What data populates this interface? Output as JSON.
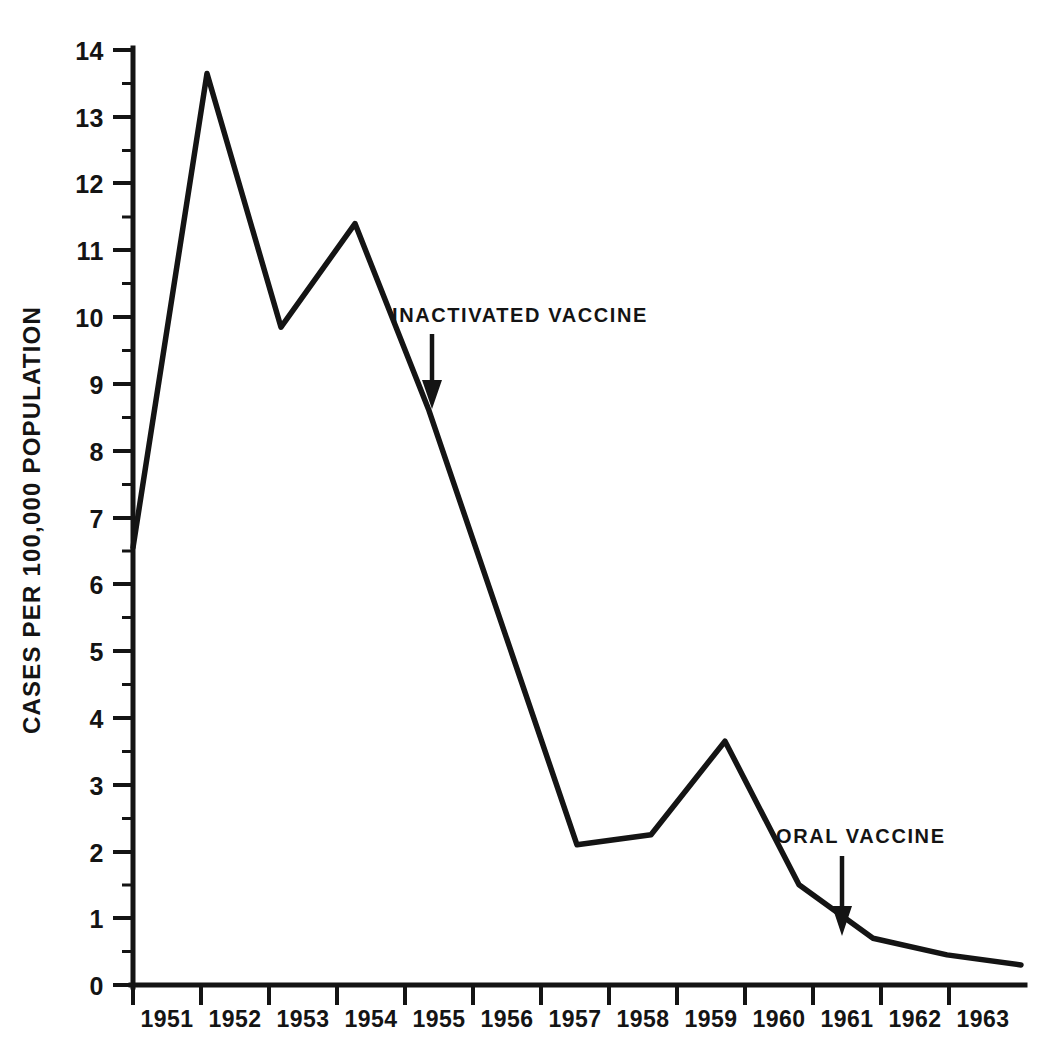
{
  "chart_data": {
    "type": "line",
    "title": "",
    "subtitle": "",
    "xlabel": "",
    "ylabel": "CASES PER 100,000 POPULATION",
    "x": [
      1951,
      1952,
      1953,
      1954,
      1955,
      1956,
      1957,
      1958,
      1959,
      1960,
      1961,
      1962,
      1963
    ],
    "categories": [
      "1951",
      "1952",
      "1953",
      "1954",
      "1955",
      "1956",
      "1957",
      "1958",
      "1959",
      "1960",
      "1961",
      "1962",
      "1963"
    ],
    "values": [
      6.55,
      13.65,
      9.85,
      11.4,
      8.6,
      5.35,
      2.1,
      2.25,
      3.65,
      1.5,
      0.7,
      0.45,
      0.3
    ],
    "vertex_years": [
      1951,
      1952,
      1953,
      1954,
      1955,
      1957,
      1958,
      1959,
      1960,
      1961,
      1962,
      1963
    ],
    "vertex_values": [
      6.55,
      13.65,
      9.85,
      11.4,
      8.6,
      2.1,
      2.25,
      3.65,
      1.5,
      0.7,
      0.45,
      0.3
    ],
    "note_on_1956": "no vertex at 1956; straight segment from 1955 to 1957",
    "ylim": [
      0,
      14
    ],
    "xlim": [
      1951,
      1963
    ],
    "ytick_labels": [
      "0",
      "1",
      "2",
      "3",
      "4",
      "5",
      "6",
      "7",
      "8",
      "9",
      "10",
      "11",
      "12",
      "13",
      "14"
    ],
    "ytick_values": [
      0,
      1,
      2,
      3,
      4,
      5,
      6,
      7,
      8,
      9,
      10,
      11,
      12,
      13,
      14
    ],
    "xtick_labels": [
      "1951",
      "1952",
      "1953",
      "1954",
      "1955",
      "1956",
      "1957",
      "1958",
      "1959",
      "1960",
      "1961",
      "1962",
      "1963"
    ],
    "grid": false,
    "legend": null,
    "legend_position": "none",
    "series": [
      {
        "name": "Reported poliomyelitis cases",
        "values": [
          6.55,
          13.65,
          9.85,
          11.4,
          8.6,
          5.35,
          2.1,
          2.25,
          3.65,
          1.5,
          0.7,
          0.45,
          0.3
        ]
      }
    ],
    "annotations": [
      {
        "id": "inactivated-vaccine",
        "text": "INACTIVATED VACCINE",
        "marker": "down-arrow",
        "points_at_year": 1955,
        "points_at_value": 8.6
      },
      {
        "id": "oral-vaccine",
        "text": "ORAL VACCINE",
        "marker": "down-arrow",
        "points_at_year": 1961,
        "points_at_value": 0.7
      }
    ],
    "colors": {
      "line": "#141414",
      "axis": "#141414",
      "text": "#141414",
      "background": "#ffffff"
    }
  },
  "axis": {
    "y_title": "CASES PER 100,000 POPULATION"
  },
  "annotations": {
    "inactivated": {
      "label": "INACTIVATED VACCINE"
    },
    "oral": {
      "label": "ORAL VACCINE"
    }
  }
}
